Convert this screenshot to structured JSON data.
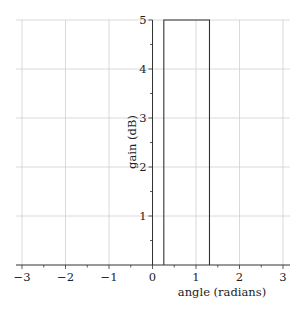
{
  "chart_data": {
    "type": "line",
    "title": "",
    "xlabel": "angle (radians)",
    "ylabel": "gain (dB)",
    "xlim": [
      -3.2,
      3.2
    ],
    "ylim": [
      0,
      5
    ],
    "xticks": [
      -3,
      -2,
      -1,
      0,
      1,
      2,
      3
    ],
    "xtick_labels": [
      "−3",
      "−2",
      "−1",
      "0",
      "1",
      "2",
      "3"
    ],
    "yticks": [
      1,
      2,
      3,
      4,
      5
    ],
    "ytick_labels": [
      "1",
      "2",
      "3",
      "4",
      "5"
    ],
    "grid": true,
    "legend": null,
    "series": [
      {
        "name": "gain",
        "description": "rectangular pulse (sector gain pattern)",
        "x": [
          0.26,
          0.26,
          1.31,
          1.31
        ],
        "y": [
          0,
          5,
          5,
          0
        ]
      }
    ]
  },
  "colors": {
    "line": "#333333",
    "grid": "#d0d0d0",
    "axis": "#333333"
  }
}
